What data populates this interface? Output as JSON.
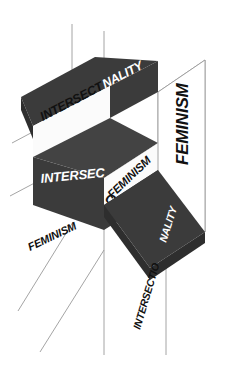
{
  "figure": {
    "background_color": "#ffffff",
    "palette": {
      "plane_dark": "#3b3b3b",
      "plane_dark_alt": "#434343",
      "plane_shadow": "#2e2e2e",
      "band_light": "#fbfbfb",
      "text_dark": "#111111",
      "text_light": "#ffffff",
      "construction_line": "#9a9a9a"
    },
    "labels": {
      "top_plane_dark_on_light": "INTERSECTIO",
      "top_plane_light_on_dark": "NALITY",
      "cube_left_face": "INTERSECT",
      "cube_front_lower": "ONALITY",
      "cube_right_face": "FEMINISM",
      "lower_left_diagonal": "FEMINISM",
      "right_panel_vertical": "FEMINISM",
      "bottom_right_diagonal_light": "INTERSECTIO",
      "bottom_right_diagonal_dark": "NALITY"
    },
    "terms": [
      "INTERSECTIONALITY",
      "FEMINISM"
    ]
  }
}
